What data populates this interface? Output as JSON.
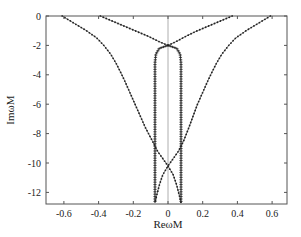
{
  "chart_data": {
    "type": "line",
    "title": "",
    "xlabel": "ReωM",
    "ylabel": "ImωM",
    "xlim": [
      -0.7,
      0.7
    ],
    "ylim": [
      -12.9,
      0
    ],
    "grid": false,
    "legend": null,
    "x_ticks": [
      -0.6,
      -0.4,
      -0.2,
      0,
      0.2,
      0.4,
      0.6
    ],
    "x_tick_labels": [
      "-0.6",
      "-0.4",
      "-0.2",
      "0",
      "0.2",
      "0.4",
      "0.6"
    ],
    "y_ticks": [
      0,
      -2,
      -4,
      -6,
      -8,
      -10,
      -12
    ],
    "y_tick_labels": [
      "0",
      "-2",
      "-4",
      "-6",
      "-8",
      "-10",
      "-12"
    ],
    "reference_line": {
      "x": 0,
      "color": "#999999"
    },
    "series": [
      {
        "name": "upper-left branch",
        "marker": "dot",
        "points": [
          [
            -0.39,
            0
          ],
          [
            -0.32,
            -0.35
          ],
          [
            -0.25,
            -0.7
          ],
          [
            -0.18,
            -1.05
          ],
          [
            -0.11,
            -1.4
          ],
          [
            -0.05,
            -1.75
          ],
          [
            0,
            -2.0
          ]
        ]
      },
      {
        "name": "upper-right branch",
        "marker": "dot",
        "points": [
          [
            0.37,
            0
          ],
          [
            0.3,
            -0.35
          ],
          [
            0.23,
            -0.7
          ],
          [
            0.16,
            -1.05
          ],
          [
            0.1,
            -1.4
          ],
          [
            0.045,
            -1.75
          ],
          [
            0,
            -2.0
          ]
        ]
      },
      {
        "name": "inner-left branch",
        "marker": "plus",
        "points": [
          [
            0,
            -2.0
          ],
          [
            -0.05,
            -2.2
          ],
          [
            -0.07,
            -2.6
          ],
          [
            -0.075,
            -3.2
          ],
          [
            -0.075,
            -4
          ],
          [
            -0.075,
            -6
          ],
          [
            -0.075,
            -8
          ],
          [
            -0.075,
            -10
          ],
          [
            -0.075,
            -12
          ],
          [
            -0.075,
            -12.7
          ]
        ]
      },
      {
        "name": "inner-right branch",
        "marker": "plus",
        "points": [
          [
            0,
            -2.0
          ],
          [
            0.05,
            -2.2
          ],
          [
            0.07,
            -2.6
          ],
          [
            0.075,
            -3.2
          ],
          [
            0.075,
            -4
          ],
          [
            0.075,
            -6
          ],
          [
            0.075,
            -8
          ],
          [
            0.075,
            -10
          ],
          [
            0.075,
            -12
          ],
          [
            0.075,
            -12.7
          ]
        ]
      },
      {
        "name": "outer-left branch",
        "marker": "dot",
        "points": [
          [
            -0.61,
            0
          ],
          [
            -0.54,
            -0.5
          ],
          [
            -0.47,
            -1.0
          ],
          [
            -0.41,
            -1.5
          ],
          [
            -0.37,
            -2.0
          ],
          [
            -0.33,
            -2.6
          ],
          [
            -0.3,
            -3.2
          ],
          [
            -0.27,
            -3.9
          ],
          [
            -0.25,
            -4.4
          ],
          [
            -0.22,
            -5.2
          ],
          [
            -0.19,
            -6.0
          ],
          [
            -0.16,
            -6.8
          ],
          [
            -0.13,
            -7.6
          ],
          [
            -0.09,
            -8.5
          ],
          [
            -0.06,
            -9.2
          ],
          [
            -0.03,
            -9.7
          ],
          [
            0,
            -10.2
          ],
          [
            0.03,
            -10.8
          ],
          [
            0.05,
            -11.5
          ],
          [
            0.065,
            -12.2
          ],
          [
            0.075,
            -12.7
          ]
        ]
      },
      {
        "name": "outer-right branch",
        "marker": "dot",
        "points": [
          [
            0.59,
            0
          ],
          [
            0.52,
            -0.5
          ],
          [
            0.45,
            -1.0
          ],
          [
            0.39,
            -1.5
          ],
          [
            0.35,
            -2.0
          ],
          [
            0.31,
            -2.6
          ],
          [
            0.28,
            -3.2
          ],
          [
            0.25,
            -3.9
          ],
          [
            0.23,
            -4.4
          ],
          [
            0.2,
            -5.2
          ],
          [
            0.17,
            -6.0
          ],
          [
            0.145,
            -6.8
          ],
          [
            0.12,
            -7.6
          ],
          [
            0.09,
            -8.5
          ],
          [
            0.06,
            -9.2
          ],
          [
            0.03,
            -9.7
          ],
          [
            0,
            -10.2
          ],
          [
            -0.03,
            -10.8
          ],
          [
            -0.05,
            -11.5
          ],
          [
            -0.065,
            -12.2
          ],
          [
            -0.075,
            -12.7
          ]
        ]
      }
    ]
  },
  "plot_area": {
    "left": 46,
    "top": 16,
    "right": 287,
    "bottom": 204,
    "x_zero_px": 168,
    "px_per_x_unit": 173.5,
    "px_per_y_unit": 14.7
  },
  "colors": {
    "axis": "#555555",
    "series": "#222222",
    "zero_line": "#999999"
  }
}
